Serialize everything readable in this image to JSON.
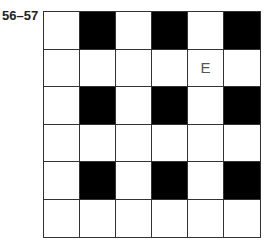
{
  "label": "56–57",
  "grid": {
    "rows": 6,
    "cols": 6,
    "cells": [
      [
        "",
        "#",
        "",
        "#",
        "",
        "#"
      ],
      [
        "",
        "",
        "",
        "",
        "E",
        ""
      ],
      [
        "",
        "#",
        "",
        "#",
        "",
        "#"
      ],
      [
        "",
        "",
        "",
        "",
        "",
        ""
      ],
      [
        "",
        "#",
        "",
        "#",
        "",
        "#"
      ],
      [
        "",
        "",
        "",
        "",
        "",
        ""
      ]
    ]
  }
}
